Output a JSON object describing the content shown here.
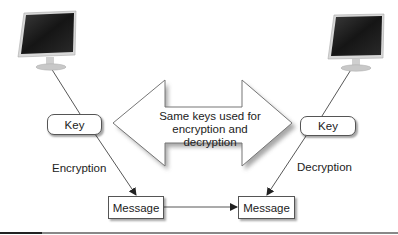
{
  "diagram": {
    "type": "symmetric-encryption",
    "left_computer": {
      "icon": "monitor-icon"
    },
    "right_computer": {
      "icon": "monitor-icon"
    },
    "left_key": {
      "label": "Key"
    },
    "right_key": {
      "label": "Key"
    },
    "left_process": {
      "label": "Encryption"
    },
    "right_process": {
      "label": "Decryption"
    },
    "left_message": {
      "label": "Message"
    },
    "right_message": {
      "label": "Message"
    },
    "shared_arrow": {
      "line1": "Same keys used for",
      "line2": "encryption and decryption"
    },
    "colors": {
      "line": "#444444",
      "box_border": "#555555",
      "arrow_fill": "#ffffff",
      "arrow_shadow": "#9a9a9a",
      "screen": "#1e1e1e",
      "bezel": "#cfcfcf",
      "rule": "#888888"
    }
  }
}
